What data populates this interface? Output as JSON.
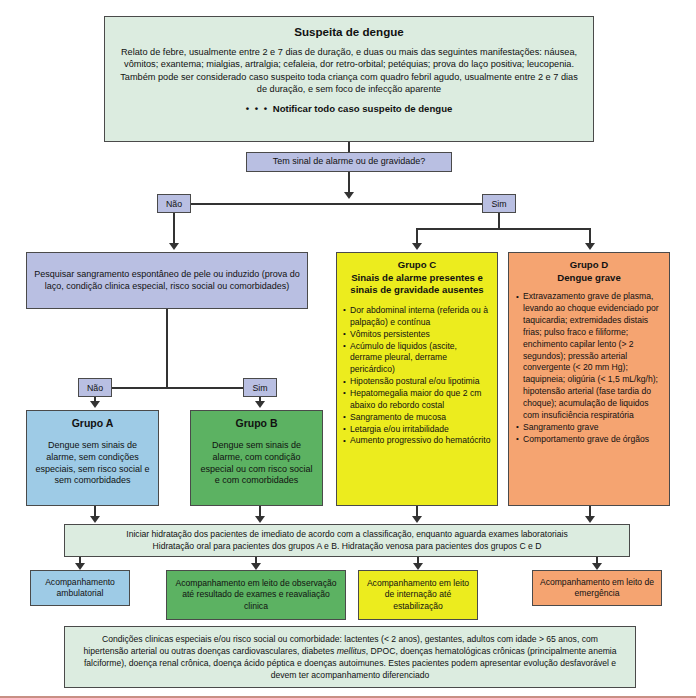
{
  "suspeita": {
    "title": "Suspeita de dengue",
    "body": "Relato de febre, usualmente entre 2 e 7 dias de duração, e duas ou mais das seguintes manifestações: náusea, vômitos; exantema; mialgias, artralgia; cefaleia, dor retro-orbital; petéquias; prova do laço positiva; leucopenia. Também pode ser considerado caso suspeito toda criança com quadro febril agudo, usualmente entre 2 e 7 dias de duração, e sem foco de infecção aparente",
    "notify_dots": "• • • ",
    "notify": "Notificar todo caso suspeito de dengue"
  },
  "decision": {
    "question": "Tem sinal de alarme ou de gravidade?",
    "no_label": "Não",
    "yes_label": "Sim"
  },
  "pesquisar": {
    "text": "Pesquisar sangramento espontâneo de pele ou induzido (prova do laço, condição clinica especial, risco social ou comorbidades)",
    "no_label": "Não",
    "yes_label": "Sim"
  },
  "grupo_a": {
    "title": "Grupo A",
    "text": "Dengue sem sinais de alarme, sem condições especiais, sem risco social e sem comorbidades"
  },
  "grupo_b": {
    "title": "Grupo B",
    "text": "Dengue sem sinais de alarme, com condição especial ou com risco social e com comorbidades"
  },
  "grupo_c": {
    "title": "Grupo C",
    "subtitle": "Sinais de alarme presentes e sinais de gravidade ausentes",
    "bullets": [
      "Dor abdominal interna (referida ou à palpação) e contínua",
      "Vômitos persistentes",
      "Acúmulo de liquidos (ascite, derrame pleural, derrame pericárdico)",
      "Hipotensão postural e/ou lipotimia",
      "Hepatomegalia maior do que 2 cm abaixo do rebordo costal",
      "Sangramento de mucosa",
      "Letargia e/ou irritabilidade",
      "Aumento progressivo do hematócrito"
    ]
  },
  "grupo_d": {
    "title": "Grupo D",
    "subtitle": "Dengue grave",
    "bullets": [
      "Extravazamento grave de plasma, levando ao choque evidenciado por taquicardia; extremidades distais frias; pulso fraco e filiforme; enchimento capilar lento (> 2 segundos); pressão arterial convergente (< 20 mm Hg); taquipneia; oligúria (< 1,5 mL/kg/h); hipotensão arterial (fase tardia do choque); acumulação de liquidos com insuficiência respiratória",
      "Sangramento grave",
      "Comportamento grave de órgãos"
    ]
  },
  "hidratacao": {
    "line1": "Iniciar hidratação dos pacientes de imediato de acordo com a classificação, enquanto aguarda exames laboratoriais",
    "line2": "Hidratação oral para pacientes dos grupos A e B. Hidratação venosa para pacientes dos grupos C e D"
  },
  "outcomes": [
    {
      "text": "Acompanhamento ambulatorial"
    },
    {
      "text": "Acompanhamento em leito de observação até resultado de exames e reavaliação clinica"
    },
    {
      "text": "Acompanhamento em leito de internação até estabilização"
    },
    {
      "text": "Acompanhamento em leito de emergência"
    }
  ],
  "footnote": {
    "part1": "Condições clinicas especiais e/ou risco social ou comorbidade: lactentes (< 2 anos), gestantes, adultos com idade > 65 anos, com hipertensão arterial ou outras doenças cardiovasculares, diabetes ",
    "italic": "mellitus",
    "part2": ", DPOC, doenças hematológicas crônicas (principalmente anemia falciforme), doença renal crônica, doença ácido péptica e doenças autoimunes. Estes pacientes podem apresentar evolução desfavorável e devem ter acompanhamento diferenciado"
  },
  "colors": {
    "mint": "#dcece0",
    "periwinkle": "#b9bfe2",
    "blue": "#9ecbe6",
    "green": "#5cb262",
    "yellow": "#ecec1e",
    "orange": "#f5a471",
    "line": "#333333",
    "rule": "#c98f84"
  }
}
